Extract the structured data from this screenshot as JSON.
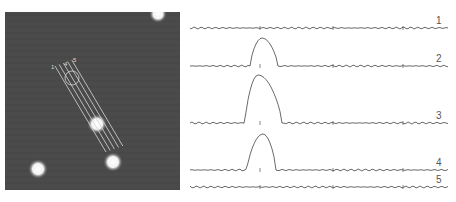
{
  "figure": {
    "left_panel": {
      "type": "fluorescence-micrograph",
      "background_color": "#4a4a4a",
      "scan_line_labels": [
        "1",
        "4",
        "5"
      ],
      "scan_line_count": 5,
      "spots": [
        {
          "cx": 153,
          "cy": 2,
          "r": 6
        },
        {
          "cx": 92,
          "cy": 112,
          "r": 7
        },
        {
          "cx": 108,
          "cy": 150,
          "r": 7
        },
        {
          "cx": 33,
          "cy": 157,
          "r": 7
        }
      ]
    },
    "right_panel": {
      "type": "intensity-profiles",
      "traces": [
        {
          "label": "1",
          "baseline_y": 28,
          "peak": null
        },
        {
          "label": "2",
          "baseline_y": 66,
          "peak": {
            "start_x": 60,
            "apex_x": 72,
            "end_x": 88,
            "height": 28
          }
        },
        {
          "label": "3",
          "baseline_y": 123,
          "peak": {
            "start_x": 55,
            "apex_x": 68,
            "end_x": 92,
            "height": 48
          }
        },
        {
          "label": "4",
          "baseline_y": 170,
          "peak": {
            "start_x": 57,
            "apex_x": 73,
            "end_x": 86,
            "height": 36
          }
        },
        {
          "label": "5",
          "baseline_y": 187,
          "peak": null
        }
      ],
      "tick_positions_x": [
        70,
        143,
        213
      ]
    },
    "caption_fragment": ""
  }
}
